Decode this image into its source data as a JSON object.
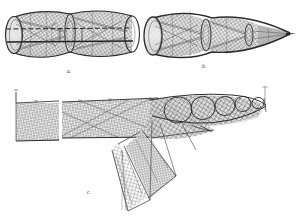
{
  "plate": {
    "medium": "engraving",
    "background_color": "#ffffff",
    "ink_color": "#2b2b2b",
    "mesh_color": "#6e6e6e",
    "shade_color": "#9a9a9a",
    "width": 298,
    "height": 220
  },
  "figures": [
    {
      "id": "a",
      "label": "a.",
      "label_x": 69,
      "label_y": 73,
      "name": "double-chamber-hoop-net",
      "description": "Cylindrical fyke net with two barrel chambers and elliptical mouth, horizontal draw cords",
      "hoops": 4,
      "chambers": 2
    },
    {
      "id": "b",
      "label": "b.",
      "label_x": 204,
      "label_y": 68,
      "name": "conical-fyke-net",
      "description": "Conical fyke net with wide elliptical mouth tapering to a pointed cod end",
      "hoops": 3,
      "chambers": 2
    },
    {
      "id": "c",
      "label": "c.",
      "label_x": 89,
      "label_y": 194,
      "name": "staked-net-installation",
      "description": "Net installation with rectangular leader panels on stakes, bunched hooped bag net and descending triangular net",
      "leader_panels": 2,
      "bag_hoops": 5
    }
  ]
}
